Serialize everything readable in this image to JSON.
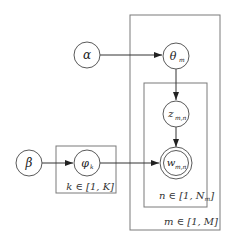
{
  "diagram": {
    "type": "plate-notation",
    "nodes": {
      "alpha": {
        "symbol": "α"
      },
      "theta": {
        "symbol": "θ",
        "subscript": "m"
      },
      "z": {
        "symbol": "z",
        "subscript": "m,n"
      },
      "w": {
        "symbol": "w",
        "subscript": "m,n",
        "observed": true
      },
      "beta": {
        "symbol": "β"
      },
      "phi": {
        "symbol": "φ",
        "subscript": "k"
      }
    },
    "edges": [
      {
        "from": "alpha",
        "to": "theta"
      },
      {
        "from": "theta",
        "to": "z"
      },
      {
        "from": "z",
        "to": "w"
      },
      {
        "from": "beta",
        "to": "phi"
      },
      {
        "from": "phi",
        "to": "w"
      }
    ],
    "plates": {
      "k": {
        "label": "k ∈ [1, K]"
      },
      "n": {
        "label": "n ∈ [1, N_m]",
        "label_main": "n ∈ [1, N",
        "label_sub": "m",
        "label_end": "]"
      },
      "m": {
        "label": "m ∈ [1, M]"
      }
    }
  }
}
